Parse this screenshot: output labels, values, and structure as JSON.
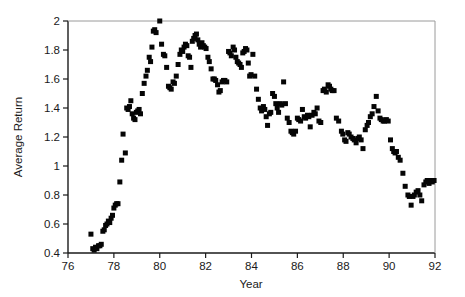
{
  "chart_data": {
    "type": "scatter",
    "title": "",
    "xlabel": "Year",
    "ylabel": "Average Return",
    "xlim": [
      76,
      92
    ],
    "ylim": [
      0.4,
      2.0
    ],
    "xticks": [
      76,
      78,
      80,
      82,
      84,
      86,
      88,
      90,
      92
    ],
    "xtick_labels": [
      "76",
      "78",
      "80",
      "82",
      "84",
      "86",
      "88",
      "90",
      "92"
    ],
    "yticks": [
      0.4,
      0.6,
      0.8,
      1.0,
      1.2,
      1.4,
      1.6,
      1.8,
      2.0
    ],
    "ytick_labels": [
      "0.4",
      "0.6",
      "0.8",
      "1",
      "1.2",
      "1.4",
      "1.6",
      "1.8",
      "2"
    ],
    "grid": false,
    "legend": false,
    "marker": "square",
    "marker_color": "#050505",
    "marker_size_px": 5,
    "series": [
      {
        "name": "Average Return",
        "points": [
          [
            77.0,
            0.53
          ],
          [
            77.08,
            0.43
          ],
          [
            77.14,
            0.42
          ],
          [
            77.2,
            0.44
          ],
          [
            77.26,
            0.43
          ],
          [
            77.33,
            0.45
          ],
          [
            77.39,
            0.45
          ],
          [
            77.45,
            0.46
          ],
          [
            77.52,
            0.55
          ],
          [
            77.58,
            0.56
          ],
          [
            77.64,
            0.59
          ],
          [
            77.7,
            0.6
          ],
          [
            77.76,
            0.62
          ],
          [
            77.82,
            0.61
          ],
          [
            77.88,
            0.64
          ],
          [
            77.94,
            0.66
          ],
          [
            78.0,
            0.71
          ],
          [
            78.06,
            0.73
          ],
          [
            78.12,
            0.74
          ],
          [
            78.18,
            0.74
          ],
          [
            78.26,
            0.89
          ],
          [
            78.34,
            1.04
          ],
          [
            78.4,
            1.22
          ],
          [
            78.5,
            1.09
          ],
          [
            78.56,
            1.4
          ],
          [
            78.62,
            1.39
          ],
          [
            78.68,
            1.41
          ],
          [
            78.74,
            1.45
          ],
          [
            78.8,
            1.36
          ],
          [
            78.86,
            1.33
          ],
          [
            78.92,
            1.32
          ],
          [
            78.98,
            1.37
          ],
          [
            79.04,
            1.38
          ],
          [
            79.1,
            1.39
          ],
          [
            79.16,
            1.36
          ],
          [
            79.24,
            1.5
          ],
          [
            79.32,
            1.57
          ],
          [
            79.4,
            1.62
          ],
          [
            79.46,
            1.66
          ],
          [
            79.54,
            1.75
          ],
          [
            79.6,
            1.72
          ],
          [
            79.66,
            1.82
          ],
          [
            79.72,
            1.93
          ],
          [
            79.78,
            1.94
          ],
          [
            79.84,
            1.92
          ],
          [
            80.0,
            2.0
          ],
          [
            80.08,
            1.84
          ],
          [
            80.16,
            1.77
          ],
          [
            80.22,
            1.76
          ],
          [
            80.3,
            1.68
          ],
          [
            80.38,
            1.55
          ],
          [
            80.44,
            1.54
          ],
          [
            80.5,
            1.53
          ],
          [
            80.58,
            1.58
          ],
          [
            80.64,
            1.57
          ],
          [
            80.72,
            1.62
          ],
          [
            80.8,
            1.7
          ],
          [
            80.88,
            1.77
          ],
          [
            80.94,
            1.8
          ],
          [
            81.0,
            1.79
          ],
          [
            81.06,
            1.82
          ],
          [
            81.12,
            1.84
          ],
          [
            81.18,
            1.83
          ],
          [
            81.24,
            1.76
          ],
          [
            81.3,
            1.75
          ],
          [
            81.36,
            1.68
          ],
          [
            81.42,
            1.86
          ],
          [
            81.48,
            1.88
          ],
          [
            81.54,
            1.9
          ],
          [
            81.6,
            1.91
          ],
          [
            81.66,
            1.87
          ],
          [
            81.72,
            1.84
          ],
          [
            81.78,
            1.82
          ],
          [
            81.84,
            1.85
          ],
          [
            81.9,
            1.83
          ],
          [
            81.96,
            1.82
          ],
          [
            82.02,
            1.81
          ],
          [
            82.1,
            1.75
          ],
          [
            82.16,
            1.72
          ],
          [
            82.24,
            1.67
          ],
          [
            82.32,
            1.6
          ],
          [
            82.38,
            1.6
          ],
          [
            82.44,
            1.59
          ],
          [
            82.52,
            1.56
          ],
          [
            82.58,
            1.51
          ],
          [
            82.64,
            1.52
          ],
          [
            82.72,
            1.58
          ],
          [
            82.78,
            1.59
          ],
          [
            82.84,
            1.59
          ],
          [
            82.92,
            1.58
          ],
          [
            83.0,
            1.79
          ],
          [
            83.06,
            1.78
          ],
          [
            83.12,
            1.76
          ],
          [
            83.2,
            1.82
          ],
          [
            83.26,
            1.8
          ],
          [
            83.32,
            1.75
          ],
          [
            83.38,
            1.72
          ],
          [
            83.44,
            1.71
          ],
          [
            83.5,
            1.7
          ],
          [
            83.56,
            1.68
          ],
          [
            83.62,
            1.78
          ],
          [
            83.68,
            1.79
          ],
          [
            83.74,
            1.81
          ],
          [
            83.8,
            1.8
          ],
          [
            83.86,
            1.71
          ],
          [
            83.92,
            1.62
          ],
          [
            83.98,
            1.63
          ],
          [
            84.06,
            1.77
          ],
          [
            84.14,
            1.62
          ],
          [
            84.22,
            1.53
          ],
          [
            84.3,
            1.46
          ],
          [
            84.38,
            1.4
          ],
          [
            84.44,
            1.38
          ],
          [
            84.52,
            1.41
          ],
          [
            84.58,
            1.39
          ],
          [
            84.64,
            1.34
          ],
          [
            84.7,
            1.28
          ],
          [
            84.78,
            1.36
          ],
          [
            84.84,
            1.37
          ],
          [
            84.92,
            1.5
          ],
          [
            85.0,
            1.48
          ],
          [
            85.06,
            1.43
          ],
          [
            85.12,
            1.4
          ],
          [
            85.18,
            1.37
          ],
          [
            85.26,
            1.43
          ],
          [
            85.32,
            1.42
          ],
          [
            85.4,
            1.58
          ],
          [
            85.48,
            1.43
          ],
          [
            85.56,
            1.33
          ],
          [
            85.64,
            1.3
          ],
          [
            85.72,
            1.24
          ],
          [
            85.78,
            1.23
          ],
          [
            85.84,
            1.22
          ],
          [
            85.92,
            1.24
          ],
          [
            86.0,
            1.33
          ],
          [
            86.06,
            1.32
          ],
          [
            86.14,
            1.31
          ],
          [
            86.22,
            1.39
          ],
          [
            86.3,
            1.34
          ],
          [
            86.36,
            1.33
          ],
          [
            86.44,
            1.35
          ],
          [
            86.5,
            1.34
          ],
          [
            86.56,
            1.27
          ],
          [
            86.64,
            1.35
          ],
          [
            86.72,
            1.37
          ],
          [
            86.78,
            1.36
          ],
          [
            86.86,
            1.4
          ],
          [
            86.94,
            1.31
          ],
          [
            87.02,
            1.3
          ],
          [
            87.12,
            1.52
          ],
          [
            87.18,
            1.53
          ],
          [
            87.26,
            1.51
          ],
          [
            87.34,
            1.56
          ],
          [
            87.4,
            1.55
          ],
          [
            87.46,
            1.53
          ],
          [
            87.52,
            1.52
          ],
          [
            87.6,
            1.52
          ],
          [
            87.7,
            1.33
          ],
          [
            87.8,
            1.31
          ],
          [
            87.92,
            1.24
          ],
          [
            87.98,
            1.22
          ],
          [
            88.06,
            1.18
          ],
          [
            88.12,
            1.17
          ],
          [
            88.2,
            1.23
          ],
          [
            88.26,
            1.22
          ],
          [
            88.34,
            1.2
          ],
          [
            88.42,
            1.19
          ],
          [
            88.48,
            1.18
          ],
          [
            88.56,
            1.16
          ],
          [
            88.64,
            1.19
          ],
          [
            88.7,
            1.2
          ],
          [
            88.78,
            1.18
          ],
          [
            88.86,
            1.12
          ],
          [
            88.96,
            1.25
          ],
          [
            89.04,
            1.28
          ],
          [
            89.1,
            1.3
          ],
          [
            89.18,
            1.34
          ],
          [
            89.26,
            1.36
          ],
          [
            89.34,
            1.41
          ],
          [
            89.44,
            1.48
          ],
          [
            89.52,
            1.38
          ],
          [
            89.6,
            1.33
          ],
          [
            89.66,
            1.32
          ],
          [
            89.74,
            1.31
          ],
          [
            89.8,
            1.31
          ],
          [
            89.88,
            1.32
          ],
          [
            89.96,
            1.31
          ],
          [
            90.06,
            1.18
          ],
          [
            90.14,
            1.12
          ],
          [
            90.2,
            1.1
          ],
          [
            90.26,
            1.09
          ],
          [
            90.32,
            1.1
          ],
          [
            90.4,
            1.06
          ],
          [
            90.48,
            1.04
          ],
          [
            90.6,
            0.95
          ],
          [
            90.7,
            0.86
          ],
          [
            90.82,
            0.8
          ],
          [
            90.88,
            0.79
          ],
          [
            90.96,
            0.73
          ],
          [
            91.04,
            0.79
          ],
          [
            91.1,
            0.8
          ],
          [
            91.18,
            0.82
          ],
          [
            91.26,
            0.83
          ],
          [
            91.34,
            0.8
          ],
          [
            91.42,
            0.76
          ],
          [
            91.52,
            0.87
          ],
          [
            91.6,
            0.89
          ],
          [
            91.66,
            0.9
          ],
          [
            91.74,
            0.88
          ],
          [
            91.82,
            0.9
          ],
          [
            91.88,
            0.89
          ],
          [
            91.96,
            0.9
          ]
        ]
      }
    ]
  },
  "axes": {
    "x_title": "Year",
    "y_title": "Average Return"
  }
}
